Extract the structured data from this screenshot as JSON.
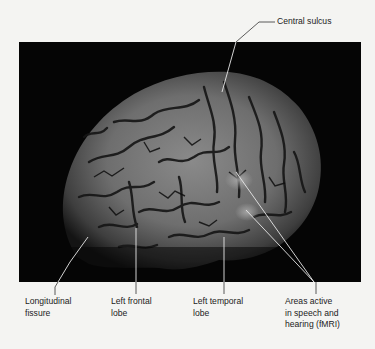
{
  "figure": {
    "background_color": "#f4f4f2",
    "panel_color": "#050505",
    "leader_color": "#e8e8e8",
    "labels": {
      "central_sulcus": "Central sulcus",
      "longitudinal_fissure": "Longitudinal\nfissure",
      "left_frontal_lobe": "Left frontal\nlobe",
      "left_temporal_lobe": "Left temporal\nlobe",
      "areas_active": "Areas active\nin speech and\nhearing (fMRI)"
    }
  }
}
